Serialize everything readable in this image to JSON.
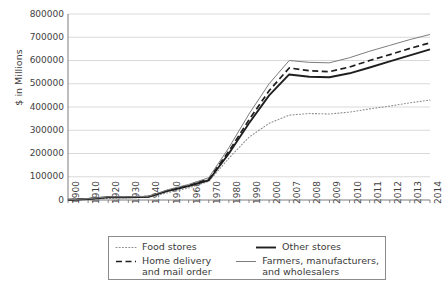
{
  "chart_data": {
    "type": "line",
    "title": "",
    "xlabel": "",
    "ylabel": "$ in Millions",
    "ylim": [
      0,
      800000
    ],
    "ytick_values": [
      800000,
      700000,
      600000,
      500000,
      400000,
      300000,
      200000,
      100000,
      0
    ],
    "ytick_labels": [
      "800000",
      "700000",
      "600000",
      "500000",
      "400000",
      "300000",
      "200000",
      "100000",
      "0"
    ],
    "grid": true,
    "legend_position": "bottom",
    "categories": [
      "1900",
      "1910",
      "1920",
      "1930",
      "1940",
      "1950",
      "1960",
      "1970",
      "1980",
      "1990",
      "2000",
      "2007",
      "2008",
      "2009",
      "2010",
      "2011",
      "2012",
      "2013",
      "2014"
    ],
    "series": [
      {
        "name": "Food stores",
        "style": "dotted",
        "color": "#8d8d8d",
        "values": [
          700,
          2500,
          7000,
          9500,
          11000,
          32000,
          52000,
          80000,
          180000,
          270000,
          330000,
          365000,
          372000,
          370000,
          378000,
          392000,
          404000,
          418000,
          430000
        ]
      },
      {
        "name": "Other stores",
        "style": "solid-bold",
        "color": "#1f1f1f",
        "values": [
          800,
          4500,
          12000,
          12000,
          14000,
          40000,
          60000,
          85000,
          200000,
          330000,
          450000,
          540000,
          530000,
          528000,
          545000,
          570000,
          596000,
          622000,
          648000
        ]
      },
      {
        "name": "Home delivery and mail order",
        "style": "dashed",
        "color": "#1f1f1f",
        "values": [
          900,
          5000,
          13000,
          13000,
          15000,
          42000,
          63000,
          90000,
          210000,
          345000,
          470000,
          568000,
          556000,
          552000,
          572000,
          600000,
          625000,
          652000,
          676000
        ]
      },
      {
        "name": "Farmers, manufacturers, and wholesalers",
        "style": "solid-thin",
        "color": "#7d7d7d",
        "values": [
          1000,
          5500,
          14000,
          14000,
          16000,
          45000,
          67000,
          96000,
          225000,
          370000,
          500000,
          600000,
          592000,
          590000,
          612000,
          640000,
          665000,
          690000,
          712000
        ]
      }
    ]
  },
  "legend": {
    "items": [
      {
        "label": "Food stores",
        "label_line2": ""
      },
      {
        "label": "Other stores",
        "label_line2": ""
      },
      {
        "label": "Home delivery",
        "label_line2": "and mail order"
      },
      {
        "label": "Farmers, manufacturers,",
        "label_line2": "and wholesalers"
      }
    ]
  }
}
